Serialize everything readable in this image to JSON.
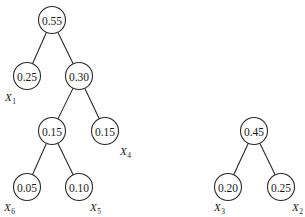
{
  "diagram": {
    "type": "huffman-trees",
    "trees": [
      {
        "root": "n055",
        "nodes": [
          {
            "id": "n055",
            "value": "0.55",
            "x": 52,
            "y": 20
          },
          {
            "id": "n025a",
            "value": "0.25",
            "x": 27,
            "y": 76,
            "label": "X",
            "label_sub": "1",
            "lx": 5,
            "ly": 101
          },
          {
            "id": "n030",
            "value": "0.30",
            "x": 79,
            "y": 76
          },
          {
            "id": "n015a",
            "value": "0.15",
            "x": 52,
            "y": 131
          },
          {
            "id": "n015b",
            "value": "0.15",
            "x": 105,
            "y": 131,
            "label": "X",
            "label_sub": "4",
            "lx": 120,
            "ly": 155
          },
          {
            "id": "n005",
            "value": "0.05",
            "x": 27,
            "y": 187,
            "label": "X",
            "label_sub": "6",
            "lx": 4,
            "ly": 211
          },
          {
            "id": "n010",
            "value": "0.10",
            "x": 79,
            "y": 187,
            "label": "X",
            "label_sub": "5",
            "lx": 90,
            "ly": 211
          }
        ],
        "edges": [
          [
            "n055",
            "n025a"
          ],
          [
            "n055",
            "n030"
          ],
          [
            "n030",
            "n015a"
          ],
          [
            "n030",
            "n015b"
          ],
          [
            "n015a",
            "n005"
          ],
          [
            "n015a",
            "n010"
          ]
        ]
      },
      {
        "root": "n045",
        "nodes": [
          {
            "id": "n045",
            "value": "0.45",
            "x": 254,
            "y": 131
          },
          {
            "id": "n020",
            "value": "0.20",
            "x": 228,
            "y": 187,
            "label": "X",
            "label_sub": "3",
            "lx": 214,
            "ly": 211
          },
          {
            "id": "n025b",
            "value": "0.25",
            "x": 281,
            "y": 187,
            "label": "X",
            "label_sub": "2",
            "lx": 292,
            "ly": 211
          }
        ],
        "edges": [
          [
            "n045",
            "n020"
          ],
          [
            "n045",
            "n025b"
          ]
        ]
      }
    ],
    "node_radius": 13.5
  }
}
